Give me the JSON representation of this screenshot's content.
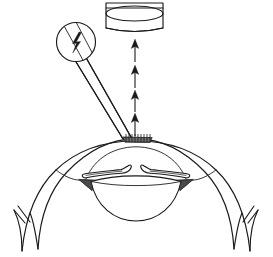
{
  "figure": {
    "title": "Anterior eye segment with transscleral probe and energy transfer arrows",
    "type": "line-drawing",
    "canvas": {
      "width": 273,
      "height": 257
    },
    "background_color": "#ffffff",
    "line_color": "#1a1a1a"
  },
  "parts": {
    "cylinder": {
      "name": "target-cylinder",
      "description": "Open cylinder drawn as rectangle with elliptical opening and bowed base",
      "x": 104,
      "y": 2,
      "width": 60,
      "height": 30
    },
    "probe_head": {
      "name": "probe-head-circle",
      "description": "Circular probe head containing lightning bolt energy symbol",
      "center_x": 76,
      "center_y": 42,
      "radius": 20,
      "symbol": "lightning-bolt"
    },
    "probe_shaft": {
      "name": "probe-shaft",
      "description": "Two-line straight shaft from probe head to corneal contact point",
      "from_x": 86,
      "from_y": 58,
      "to_x": 127,
      "to_y": 137
    },
    "contact_zone": {
      "name": "corneal-contact-zone",
      "description": "Hatched contact footprint where probe meets the cornea",
      "center_x": 137,
      "center_y": 138
    },
    "arrows": {
      "name": "energy-arrow-stack",
      "direction": "up",
      "count": 4,
      "x": 135,
      "tips_y": [
        40,
        66,
        92,
        115
      ],
      "tails_y": [
        62,
        88,
        112,
        136
      ]
    },
    "cornea": {
      "name": "cornea",
      "description": "Double-contour dome at top of globe"
    },
    "anterior_chamber": {
      "name": "anterior-chamber",
      "description": "Space between cornea and iris/lens"
    },
    "iris_left": {
      "name": "iris-leaflet-left"
    },
    "iris_right": {
      "name": "iris-leaflet-right"
    },
    "lens": {
      "name": "crystalline-lens",
      "center_x": 136,
      "center_y": 196
    },
    "angle_left": {
      "name": "iridocorneal-angle-left",
      "shaded": true
    },
    "angle_right": {
      "name": "iridocorneal-angle-right",
      "shaded": true
    },
    "sclera_left": {
      "name": "sclera-wall-left"
    },
    "sclera_right": {
      "name": "sclera-wall-right"
    },
    "break_marks_left": {
      "name": "break-marks-left",
      "count": 2
    },
    "break_marks_right": {
      "name": "break-marks-right",
      "count": 2
    }
  },
  "labels": {
    "none_visible": ""
  }
}
